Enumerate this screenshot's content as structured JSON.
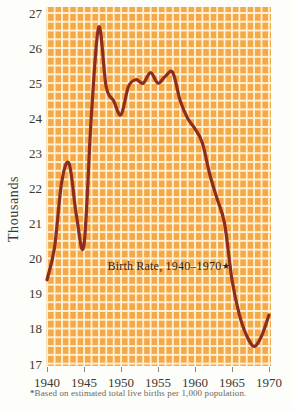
{
  "chart_data": {
    "type": "line",
    "title": "Birth Rate, 1940–1970",
    "title_marker": "★",
    "ylabel": "Thousands",
    "footnote_marker": "*",
    "footnote_text": "Based on estimated total live births per 1,000 population.",
    "xlim": [
      1940,
      1970
    ],
    "ylim": [
      17,
      27
    ],
    "xticks": [
      1940,
      1945,
      1950,
      1955,
      1960,
      1965,
      1970
    ],
    "yticks": [
      27,
      26,
      25,
      24,
      23,
      22,
      21,
      20,
      19,
      18,
      17
    ],
    "grid": "fine tile grid: vertical line each year, horizontal line each 0.25 units",
    "legend_position": "none",
    "x": [
      1940,
      1941,
      1942,
      1943,
      1944,
      1945,
      1946,
      1947,
      1948,
      1949,
      1950,
      1951,
      1952,
      1953,
      1954,
      1955,
      1956,
      1957,
      1958,
      1959,
      1960,
      1961,
      1962,
      1963,
      1964,
      1965,
      1966,
      1967,
      1968,
      1969,
      1970
    ],
    "series": [
      {
        "name": "Birth rate per 1,000 population",
        "values": [
          19.4,
          20.3,
          22.2,
          22.7,
          21.2,
          20.4,
          24.1,
          26.6,
          24.9,
          24.5,
          24.1,
          24.9,
          25.1,
          25.0,
          25.3,
          25.0,
          25.2,
          25.3,
          24.5,
          24.0,
          23.7,
          23.3,
          22.4,
          21.7,
          21.0,
          19.4,
          18.4,
          17.8,
          17.5,
          17.8,
          18.4
        ]
      }
    ],
    "colors": {
      "line": "#8E2C1E",
      "plot_background": "#F4A846",
      "grid": "#FBF0D6",
      "axis_text": "#40382e",
      "footnote_text": "#6e675c",
      "tick": "#8f887c"
    }
  }
}
